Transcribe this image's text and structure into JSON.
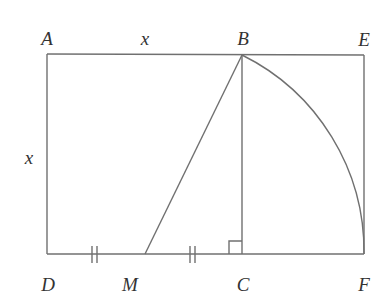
{
  "diagram": {
    "stroke_color": "#707070",
    "label_color": "#333333",
    "points": {
      "A": {
        "label": "A",
        "x": 47,
        "y": 54,
        "lx": 47,
        "ly": 38
      },
      "B": {
        "label": "B",
        "x": 242,
        "y": 55,
        "lx": 243,
        "ly": 38
      },
      "E": {
        "label": "E",
        "x": 364,
        "y": 55,
        "lx": 364,
        "ly": 39
      },
      "D": {
        "label": "D",
        "x": 47,
        "y": 254,
        "lx": 48,
        "ly": 284
      },
      "M": {
        "label": "M",
        "x": 145,
        "y": 254,
        "lx": 130,
        "ly": 284
      },
      "C": {
        "label": "C",
        "x": 242,
        "y": 254,
        "lx": 243,
        "ly": 284
      },
      "F": {
        "label": "F",
        "x": 364,
        "y": 254,
        "lx": 364,
        "ly": 284
      }
    },
    "side_labels": [
      {
        "id": "top-x",
        "text": "x",
        "x": 145,
        "y": 38
      },
      {
        "id": "left-x",
        "text": "x",
        "x": 29,
        "y": 157
      }
    ],
    "segments": [
      {
        "name": "segment-AE",
        "from": "A",
        "to": "E"
      },
      {
        "name": "segment-AD",
        "from": "A",
        "to": "D"
      },
      {
        "name": "segment-DF",
        "from": "D",
        "to": "F"
      },
      {
        "name": "segment-EF",
        "from": "E",
        "to": "F"
      },
      {
        "name": "segment-BC",
        "from": "B",
        "to": "C"
      },
      {
        "name": "segment-MB",
        "from": "M",
        "to": "B"
      }
    ],
    "arc": {
      "name": "arc-BF",
      "center": "M",
      "from": "B",
      "to": "F"
    },
    "tick_marks": [
      {
        "name": "tick-DM",
        "xs": [
          92,
          97
        ],
        "y": 254
      },
      {
        "name": "tick-MC",
        "xs": [
          190,
          195
        ],
        "y": 254
      }
    ],
    "right_angle": {
      "name": "right-angle-C",
      "x": 229,
      "y": 241,
      "size": 13
    }
  }
}
